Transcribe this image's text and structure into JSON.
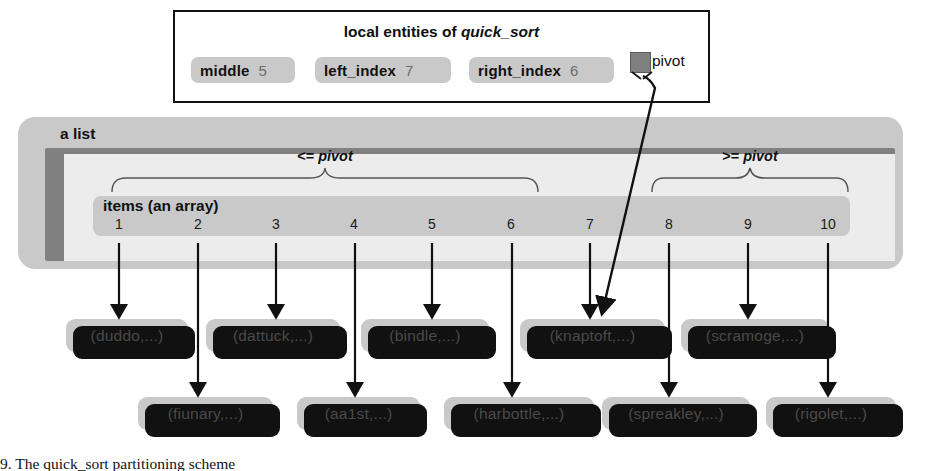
{
  "entities_panel": {
    "title_prefix": "local entities of ",
    "title_routine": "quick_sort",
    "entities": [
      {
        "name": "middle",
        "value": "5"
      },
      {
        "name": "left_index",
        "value": "7"
      },
      {
        "name": "right_index",
        "value": "6"
      }
    ],
    "pivot_ref": {
      "label": "pivot",
      "icon": "filled-square-object-icon"
    }
  },
  "list_object": {
    "name": "a list",
    "array_name": "items (an array)",
    "indices": [
      "1",
      "2",
      "3",
      "4",
      "5",
      "6",
      "7",
      "8",
      "9",
      "10"
    ],
    "partitions": [
      {
        "id": "left-partition",
        "label_op": "<= ",
        "label_ref": "pivot",
        "from_index": "1",
        "to_index": "6"
      },
      {
        "id": "right-partition",
        "label_op": ">= ",
        "label_ref": "pivot",
        "from_index": "8",
        "to_index": "10"
      }
    ]
  },
  "items": [
    {
      "index": "1",
      "label": "(duddo,...)",
      "row": "upper"
    },
    {
      "index": "2",
      "label": "(fiunary,...)",
      "row": "lower"
    },
    {
      "index": "3",
      "label": "(dattuck,...)",
      "row": "upper"
    },
    {
      "index": "4",
      "label": "(aa1st,...)",
      "row": "lower"
    },
    {
      "index": "5",
      "label": "(bindle,...)",
      "row": "upper"
    },
    {
      "index": "6",
      "label": "(harbottle,...)",
      "row": "lower"
    },
    {
      "index": "7",
      "label": "(knaptoft,...)",
      "row": "upper"
    },
    {
      "index": "8",
      "label": "(spreakley,...)",
      "row": "lower"
    },
    {
      "index": "9",
      "label": "(scramoge,...)",
      "row": "upper"
    },
    {
      "index": "10",
      "label": "(rigolet,...)",
      "row": "lower"
    }
  ],
  "colors": {
    "object_fill": "#c9c9c9",
    "shadow": "#111111",
    "inner_frame": "#808080",
    "inner_body": "#ececec",
    "value_text": "#6d6d6d"
  },
  "caption": "9. The quick_sort partitioning scheme"
}
